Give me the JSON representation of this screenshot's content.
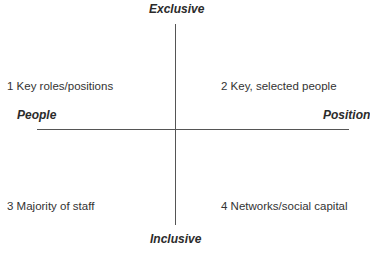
{
  "axes": {
    "top": "Exclusive",
    "bottom": "Inclusive",
    "left": "People",
    "right": "Position"
  },
  "quadrants": [
    {
      "number": "1",
      "label": "Key roles/positions",
      "position": "top-left"
    },
    {
      "number": "2",
      "label": "Key, selected people",
      "position": "top-right"
    },
    {
      "number": "3",
      "label": "Majority of staff",
      "position": "bottom-left"
    },
    {
      "number": "4",
      "label": "Networks/social capital",
      "position": "bottom-right"
    }
  ],
  "colors": {
    "line": "#555555",
    "text": "#333333",
    "background": "#ffffff"
  }
}
